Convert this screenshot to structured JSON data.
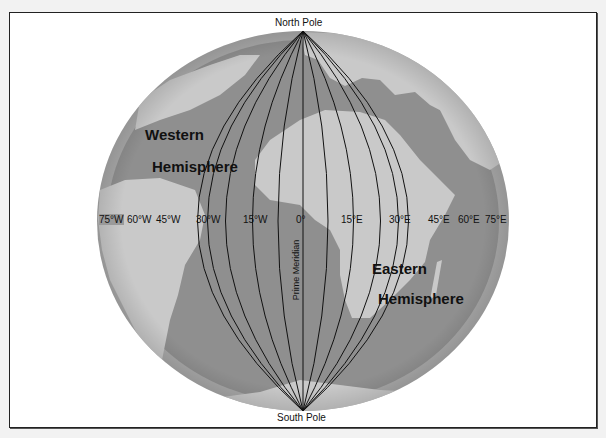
{
  "diagram": {
    "type": "globe-meridians",
    "labels": {
      "north_pole": "North Pole",
      "south_pole": "South Pole",
      "prime_meridian": "Prime Meridian",
      "western_line1": "Western",
      "western_line2": "Hemisphere",
      "eastern_line1": "Eastern",
      "eastern_line2": "Hemisphere"
    },
    "meridians": [
      {
        "label": "75°W",
        "deg": -75
      },
      {
        "label": "60°W",
        "deg": -60
      },
      {
        "label": "45°W",
        "deg": -45
      },
      {
        "label": "30°W",
        "deg": -30
      },
      {
        "label": "15°W",
        "deg": -15
      },
      {
        "label": "0°",
        "deg": 0
      },
      {
        "label": "15°E",
        "deg": 15
      },
      {
        "label": "30°E",
        "deg": 30
      },
      {
        "label": "45°E",
        "deg": 45
      },
      {
        "label": "60°E",
        "deg": 60
      },
      {
        "label": "75°E",
        "deg": 75
      }
    ],
    "colors": {
      "ocean": "#8f8f8f",
      "land": "#c9c9c9",
      "rim": "#a8a8a8",
      "lines": "#111111",
      "background": "#ffffff"
    }
  }
}
